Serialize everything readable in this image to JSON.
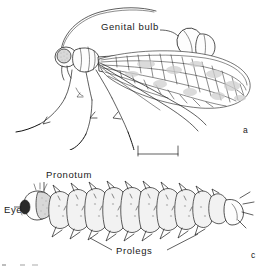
{
  "figure": {
    "type": "scientific-line-drawing-plate",
    "background_color": "#ffffff",
    "ink_color": "#1b1b1b",
    "panels": [
      {
        "letter": "a",
        "subject": "adult insect, lateral view",
        "labels": [
          "Genital bulb"
        ]
      },
      {
        "letter": "c",
        "subject": "larva, lateral view",
        "labels": [
          "Pronotum",
          "Eye",
          "Prolegs"
        ]
      }
    ],
    "scale_bar": {
      "present": true,
      "style": "I-bar with end ticks",
      "caption": ""
    }
  },
  "labels": {
    "genital_bulb": "Genital bulb",
    "pronotum": "Pronotum",
    "eye": "Eye",
    "prolegs": "Prolegs"
  },
  "panel_letters": {
    "adult": "a",
    "larva": "c"
  },
  "colors": {
    "ink": "#1b1b1b",
    "eye_shade": "#d8d8d8",
    "dark_eye": "#2a2a2a",
    "wing_mottle": "#9a9a9a",
    "segment_shade": "#f2f2f2",
    "background": "#ffffff"
  }
}
